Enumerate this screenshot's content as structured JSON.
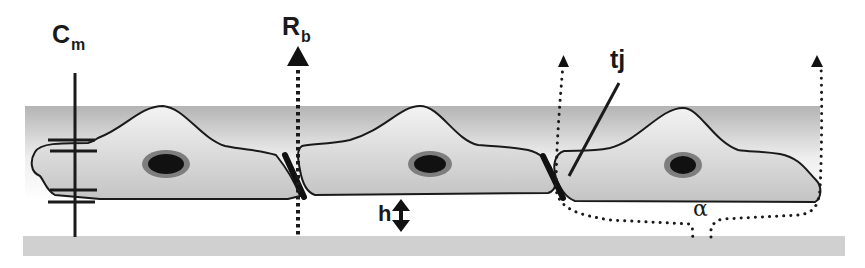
{
  "figure": {
    "type": "schematic",
    "colors": {
      "background": "#ffffff",
      "medium_band_top": "#b8b8b8",
      "medium_band_mid": "#f2f2f2",
      "cell_fill": "#d2d2d2",
      "cell_outline": "#1a1a1a",
      "nucleus_outer": "#7a7a7a",
      "nucleus_inner": "#111111",
      "substrate": "#cfcfcf",
      "lines": "#1a1a1a"
    }
  },
  "labels": {
    "cm": {
      "main": "C",
      "sub": "m"
    },
    "rb": {
      "main": "R",
      "sub": "b"
    },
    "tj": {
      "text": "tj"
    },
    "h": {
      "text": "h"
    },
    "alpha": {
      "text": "α"
    }
  },
  "elements": {
    "cells": [
      {
        "name": "cell-left",
        "nucleus": true
      },
      {
        "name": "cell-middle",
        "nucleus": true
      },
      {
        "name": "cell-right",
        "nucleus": true
      }
    ],
    "tight_junctions": 2,
    "capacitor_symbol": "membrane capacitance",
    "rb_path": "paracellular current path (dotted arrow)",
    "alpha_path": "subcellular current path (dotted loop)",
    "h_arrow": "cell-substrate distance (double arrow)"
  }
}
